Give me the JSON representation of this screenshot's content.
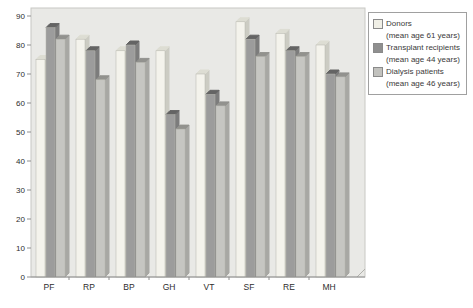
{
  "chart_data": {
    "type": "bar",
    "style": "3d-bars",
    "title": "",
    "xlabel": "",
    "ylabel": "",
    "categories": [
      "PF",
      "RP",
      "BP",
      "GH",
      "VT",
      "SF",
      "RE",
      "MH"
    ],
    "series": [
      {
        "name": "Donors",
        "subtitle": "(mean age 61 years)",
        "values": [
          75,
          82,
          78,
          78,
          70,
          88,
          84,
          80
        ],
        "color_front": "#f4f3ec",
        "color_top": "#ddddd3",
        "color_side": "#ccccc3",
        "swatch_color": "#f0efe6"
      },
      {
        "name": "Transplant recipients",
        "subtitle": "(mean age 44 years)",
        "values": [
          86,
          78,
          80,
          56,
          63,
          82,
          78,
          70
        ],
        "color_front": "#9c9c9c",
        "color_top": "#646464",
        "color_side": "#7c7c7c",
        "swatch_color": "#8f8f8f"
      },
      {
        "name": "Dialysis patients",
        "subtitle": "(mean age 46 years)",
        "values": [
          82,
          68,
          74,
          51,
          59,
          76,
          76,
          69
        ],
        "color_front": "#c6c6c2",
        "color_top": "#92928e",
        "color_side": "#a8a8a4",
        "swatch_color": "#c2c2be"
      }
    ],
    "ylim": [
      0,
      90
    ],
    "yticks": [
      0,
      10,
      20,
      30,
      40,
      50,
      60,
      70,
      80,
      90
    ],
    "grid": false,
    "legend_position": "top-right"
  },
  "colors": {
    "plot_background": "#e9e9e6",
    "plot_border": "#c8c8c4",
    "axis_line": "#8f8f8f",
    "tick_text": "#2d2d2d",
    "floor_edge": "#b0b0ab"
  }
}
